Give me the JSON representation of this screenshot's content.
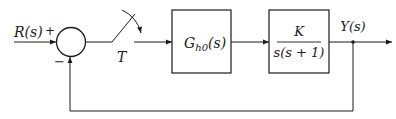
{
  "diagram": {
    "type": "sampled-data feedback control block diagram",
    "input": {
      "label": "R(s)"
    },
    "summing_junction": {
      "plus_sign": "+",
      "minus_sign": "−"
    },
    "sampler": {
      "label": "T"
    },
    "blocks": [
      {
        "id": "zoh",
        "label": "G",
        "subscript": "h0",
        "suffix": "(s)"
      },
      {
        "id": "plant",
        "numerator": "K",
        "denominator": "s(s + 1)"
      }
    ],
    "output": {
      "label": "Y(s)"
    },
    "feedback": {
      "type": "unity negative feedback"
    },
    "colors": {
      "line": "#1a1a1a",
      "background": "#ffffff"
    }
  }
}
